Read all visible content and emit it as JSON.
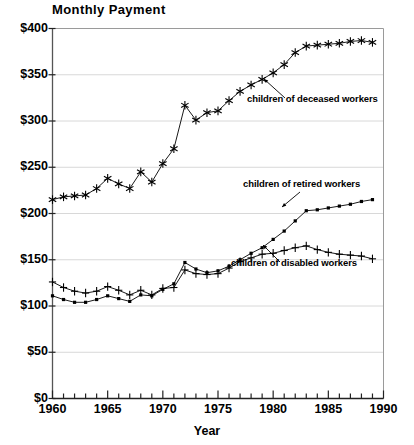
{
  "chart_data": {
    "type": "line",
    "title": "Monthly Payment",
    "xlabel": "Year",
    "ylabel": "",
    "xlim": [
      1960,
      1990
    ],
    "ylim": [
      0,
      400
    ],
    "grid": true,
    "legend_position": "inline-annotations",
    "x_tick_labels": [
      "1960",
      "1965",
      "1970",
      "1975",
      "1980",
      "1985",
      "1990"
    ],
    "x_tick_values": [
      1960,
      1965,
      1970,
      1975,
      1980,
      1985,
      1990
    ],
    "x_minor_ticks_every": 1,
    "y_tick_labels": [
      "$0",
      "$50",
      "$100",
      "$150",
      "$200",
      "$250",
      "$300",
      "$350",
      "$400"
    ],
    "y_tick_values": [
      0,
      50,
      100,
      150,
      200,
      250,
      300,
      350,
      400
    ],
    "x": [
      1960,
      1961,
      1962,
      1963,
      1964,
      1965,
      1966,
      1967,
      1968,
      1969,
      1970,
      1971,
      1972,
      1973,
      1974,
      1975,
      1976,
      1977,
      1978,
      1979,
      1980,
      1981,
      1982,
      1983,
      1984,
      1985,
      1986,
      1987,
      1988,
      1989
    ],
    "series": [
      {
        "name": "children of deceased workers",
        "marker": "asterisk",
        "annotation": "children of deceased workers",
        "values": [
          215,
          218,
          219,
          220,
          227,
          238,
          232,
          227,
          245,
          234,
          254,
          270,
          317,
          301,
          309,
          311,
          322,
          332,
          339,
          345,
          352,
          361,
          374,
          381,
          382,
          383,
          384,
          386,
          387,
          385
        ]
      },
      {
        "name": "children of retired workers",
        "marker": "dot",
        "annotation": "children of retired workers",
        "values": [
          111,
          107,
          104,
          104,
          107,
          111,
          108,
          105,
          112,
          111,
          118,
          124,
          147,
          140,
          136,
          138,
          143,
          150,
          157,
          163,
          172,
          181,
          192,
          203,
          204,
          206,
          208,
          210,
          213,
          215
        ]
      },
      {
        "name": "children of disabled workers",
        "marker": "plus",
        "annotation": "children of disabled workers",
        "values": [
          126,
          120,
          116,
          114,
          116,
          121,
          117,
          112,
          117,
          112,
          119,
          120,
          139,
          135,
          134,
          135,
          141,
          148,
          152,
          156,
          157,
          160,
          163,
          165,
          161,
          158,
          156,
          155,
          154,
          151
        ]
      }
    ]
  },
  "annotations": {
    "deceased": "children of deceased workers",
    "retired": "children of retired workers",
    "disabled": "children of disabled workers"
  }
}
